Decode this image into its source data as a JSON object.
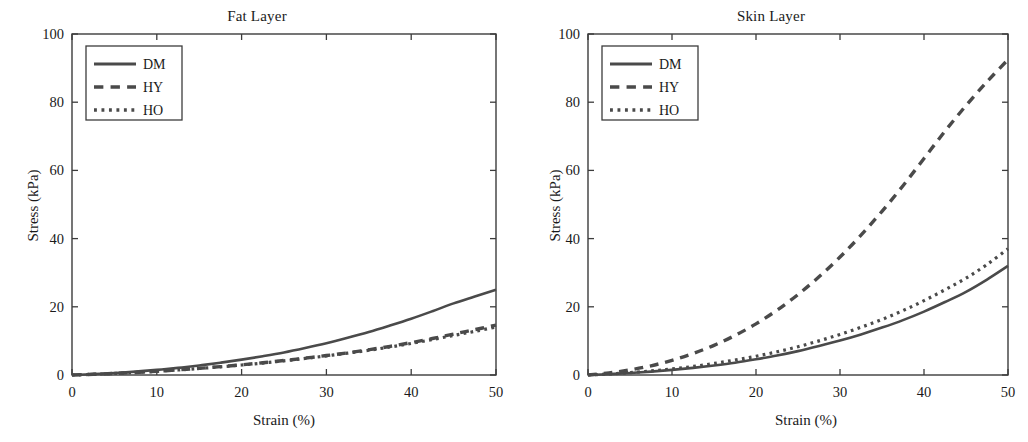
{
  "figure": {
    "background": "#ffffff",
    "line_color": "#4a4a4a",
    "axis_color": "#3c3c3c",
    "panels": [
      {
        "id": "fat-layer",
        "title": "Fat Layer",
        "xlabel": "Strain (%)",
        "ylabel": "Stress (kPa)"
      },
      {
        "id": "skin-layer",
        "title": "Skin Layer",
        "xlabel": "Strain (%)",
        "ylabel": "Stress (kPa)"
      }
    ]
  },
  "legend": {
    "entries": [
      {
        "label": "DM",
        "style": "solid"
      },
      {
        "label": "HY",
        "style": "dashed"
      },
      {
        "label": "HO",
        "style": "dotted"
      }
    ]
  },
  "chart_data": [
    {
      "type": "line",
      "title": "Fat Layer",
      "xlabel": "Strain (%)",
      "ylabel": "Stress (kPa)",
      "xlim": [
        0,
        50
      ],
      "ylim": [
        0,
        100
      ],
      "xticks": [
        0,
        10,
        20,
        30,
        40,
        50
      ],
      "yticks": [
        0,
        20,
        40,
        60,
        80,
        100
      ],
      "grid": false,
      "legend_position": "upper left",
      "x": [
        0,
        2.5,
        5,
        7.5,
        10,
        12.5,
        15,
        17.5,
        20,
        22.5,
        25,
        27.5,
        30,
        32.5,
        35,
        37.5,
        40,
        42.5,
        45,
        47.5,
        50
      ],
      "series": [
        {
          "name": "DM",
          "style": "solid",
          "values": [
            0,
            0.25,
            0.6,
            1.0,
            1.5,
            2.1,
            2.8,
            3.6,
            4.5,
            5.5,
            6.6,
            7.9,
            9.3,
            10.9,
            12.6,
            14.5,
            16.5,
            18.7,
            21.0,
            23.0,
            25.0
          ]
        },
        {
          "name": "HY",
          "style": "dashed",
          "values": [
            0,
            0.2,
            0.45,
            0.75,
            1.1,
            1.5,
            1.95,
            2.45,
            3.0,
            3.6,
            4.25,
            4.95,
            5.7,
            6.5,
            7.4,
            8.4,
            9.5,
            10.7,
            12.0,
            13.3,
            14.6
          ]
        },
        {
          "name": "HO",
          "style": "dotted",
          "values": [
            0,
            0.2,
            0.45,
            0.73,
            1.07,
            1.46,
            1.9,
            2.4,
            2.93,
            3.5,
            4.15,
            4.85,
            5.6,
            6.4,
            7.25,
            8.2,
            9.25,
            10.4,
            11.6,
            12.8,
            14.1
          ]
        }
      ]
    },
    {
      "type": "line",
      "title": "Skin Layer",
      "xlabel": "Strain (%)",
      "ylabel": "Stress (kPa)",
      "xlim": [
        0,
        50
      ],
      "ylim": [
        0,
        100
      ],
      "xticks": [
        0,
        10,
        20,
        30,
        40,
        50
      ],
      "yticks": [
        0,
        20,
        40,
        60,
        80,
        100
      ],
      "grid": false,
      "legend_position": "upper left",
      "x": [
        0,
        2.5,
        5,
        7.5,
        10,
        12.5,
        15,
        17.5,
        20,
        22.5,
        25,
        27.5,
        30,
        32.5,
        35,
        37.5,
        40,
        42.5,
        45,
        47.5,
        50
      ],
      "series": [
        {
          "name": "DM",
          "style": "solid",
          "values": [
            0,
            0.25,
            0.6,
            1.0,
            1.5,
            2.1,
            2.8,
            3.6,
            4.6,
            5.7,
            7.0,
            8.5,
            10.1,
            11.9,
            13.9,
            16.1,
            18.6,
            21.4,
            24.4,
            28.0,
            32.0
          ]
        },
        {
          "name": "HY",
          "style": "dashed",
          "values": [
            0,
            0.6,
            1.5,
            2.7,
            4.3,
            6.3,
            8.7,
            11.6,
            15.0,
            19.0,
            23.6,
            28.8,
            34.6,
            41.0,
            48.0,
            55.5,
            63.5,
            71.5,
            79.0,
            86.0,
            92.5
          ]
        },
        {
          "name": "HO",
          "style": "dotted",
          "values": [
            0,
            0.3,
            0.7,
            1.2,
            1.8,
            2.5,
            3.4,
            4.4,
            5.5,
            6.8,
            8.3,
            10.0,
            11.9,
            14.0,
            16.3,
            18.9,
            21.8,
            25.0,
            28.4,
            32.4,
            37.0
          ]
        }
      ]
    }
  ]
}
